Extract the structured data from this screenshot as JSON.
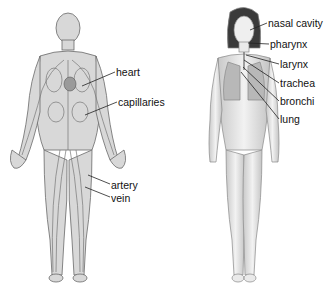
{
  "figures": [
    {
      "name": "circulatory-system",
      "labels": [
        {
          "id": "heart",
          "text": "heart",
          "x": 116,
          "y": 66,
          "target": [
            82,
            86
          ]
        },
        {
          "id": "capillaries",
          "text": "capillaries",
          "x": 118,
          "y": 96,
          "target": [
            85,
            115
          ]
        },
        {
          "id": "artery",
          "text": "artery",
          "x": 111,
          "y": 179,
          "target": [
            88,
            175
          ]
        },
        {
          "id": "vein",
          "text": "vein",
          "x": 111,
          "y": 192,
          "target": [
            85,
            187
          ]
        }
      ]
    },
    {
      "name": "respiratory-system",
      "labels": [
        {
          "id": "nasal-cavity",
          "text": "nasal cavity",
          "x": 268,
          "y": 17,
          "target": [
            250,
            30
          ]
        },
        {
          "id": "pharynx",
          "text": "pharynx",
          "x": 270,
          "y": 38,
          "target": [
            248,
            43
          ]
        },
        {
          "id": "larynx",
          "text": "larynx",
          "x": 280,
          "y": 58,
          "target": [
            246,
            55
          ]
        },
        {
          "id": "trachea",
          "text": "trachea",
          "x": 280,
          "y": 77,
          "target": [
            244,
            60
          ]
        },
        {
          "id": "bronchi",
          "text": "bronchi",
          "x": 280,
          "y": 95,
          "target": [
            243,
            67
          ]
        },
        {
          "id": "lung",
          "text": "lung",
          "x": 280,
          "y": 113,
          "target": [
            241,
            72
          ]
        }
      ]
    }
  ]
}
